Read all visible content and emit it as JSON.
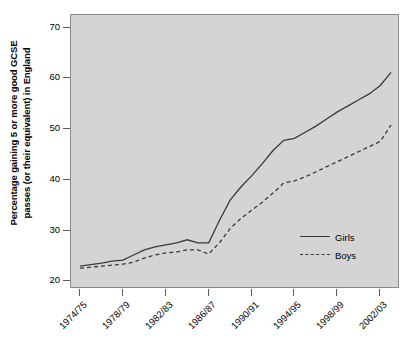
{
  "chart_data": {
    "type": "line",
    "title": "",
    "xlabel": "",
    "ylabel": "Percentage gaining 5 or more good GCSE passes (or their equivalent) in England",
    "ylabel_line1": "Percentage gaining 5 or more good GCSE",
    "ylabel_line2": "passes (or their equivalent) in England",
    "ylim": [
      18.5,
      72.5
    ],
    "yticks": [
      20,
      30,
      40,
      50,
      60,
      70
    ],
    "xticklabels": [
      "1974/75",
      "1978/79",
      "1982/83",
      "1986/87",
      "1990/91",
      "1994/95",
      "1998/99",
      "2002/03"
    ],
    "xtickindices": [
      0,
      4,
      8,
      12,
      16,
      20,
      24,
      28
    ],
    "grid": false,
    "legend_position": "bottom-right",
    "panel_background": "#d4d4d4",
    "line_color": "#3a3a3a",
    "x": [
      "1974/75",
      "1975/76",
      "1976/77",
      "1977/78",
      "1978/79",
      "1979/80",
      "1980/81",
      "1981/82",
      "1982/83",
      "1983/84",
      "1984/85",
      "1985/86",
      "1986/87",
      "1987/88",
      "1988/89",
      "1989/90",
      "1990/91",
      "1991/92",
      "1992/93",
      "1993/94",
      "1994/95",
      "1995/96",
      "1996/97",
      "1997/98",
      "1998/99",
      "1999/2000",
      "2000/01",
      "2001/02",
      "2002/03",
      "2003/04"
    ],
    "series": [
      {
        "name": "Girls",
        "style": "solid",
        "values": [
          23.0,
          23.3,
          23.6,
          24.0,
          24.2,
          25.2,
          26.2,
          26.8,
          27.2,
          27.6,
          28.2,
          27.6,
          27.6,
          32.0,
          36.0,
          38.6,
          40.8,
          43.2,
          45.8,
          47.8,
          48.2,
          49.4,
          50.6,
          52.0,
          53.4,
          54.6,
          55.8,
          57.0,
          58.6,
          61.2
        ]
      },
      {
        "name": "Boys",
        "style": "dashed",
        "values": [
          22.6,
          22.8,
          23.0,
          23.2,
          23.4,
          23.8,
          24.6,
          25.2,
          25.6,
          25.8,
          26.2,
          26.2,
          25.4,
          27.6,
          30.4,
          32.4,
          34.0,
          35.6,
          37.4,
          39.4,
          39.8,
          40.6,
          41.6,
          42.6,
          43.6,
          44.6,
          45.6,
          46.6,
          47.6,
          50.8
        ]
      }
    ]
  },
  "legend": {
    "items": [
      {
        "label": "Girls",
        "style": "solid"
      },
      {
        "label": "Boys",
        "style": "dashed"
      }
    ]
  }
}
